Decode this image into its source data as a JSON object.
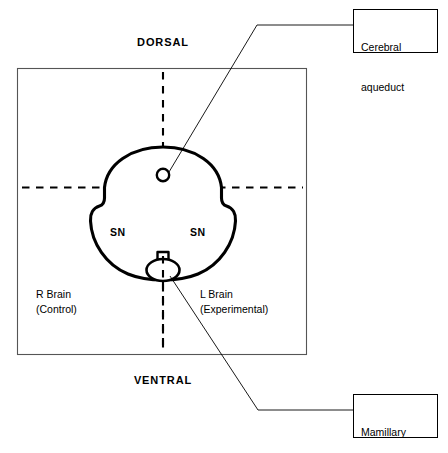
{
  "figure": {
    "type": "anatomical-diagram",
    "orientation": {
      "top_label": "DORSAL",
      "bottom_label": "VENTRAL"
    },
    "hemispheres": {
      "right": {
        "line1": "R Brain",
        "line2": "(Control)"
      },
      "left": {
        "line1": "L Brain",
        "line2": "(Experimental)"
      }
    },
    "structures": [
      {
        "id": "sn-right",
        "label": "SN",
        "name": "substantia-nigra-right"
      },
      {
        "id": "sn-left",
        "label": "SN",
        "name": "substantia-nigra-left"
      }
    ],
    "callouts": [
      {
        "id": "cerebral-aqueduct",
        "line1": "Cerebral",
        "line2": "aqueduct"
      },
      {
        "id": "mamillary-body",
        "line1": "Mamillary",
        "line2": "body"
      }
    ],
    "colors": {
      "stroke": "#000000",
      "background": "#ffffff",
      "frame": "#555555"
    }
  }
}
